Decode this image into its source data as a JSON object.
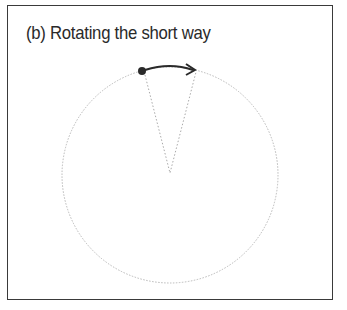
{
  "figure": {
    "title": "(b) Rotating the short way",
    "colors": {
      "border": "#3a3a3a",
      "circle": "#b5b5b5",
      "arrow": "#2a2a2a",
      "point": "#2a2a2a"
    }
  }
}
